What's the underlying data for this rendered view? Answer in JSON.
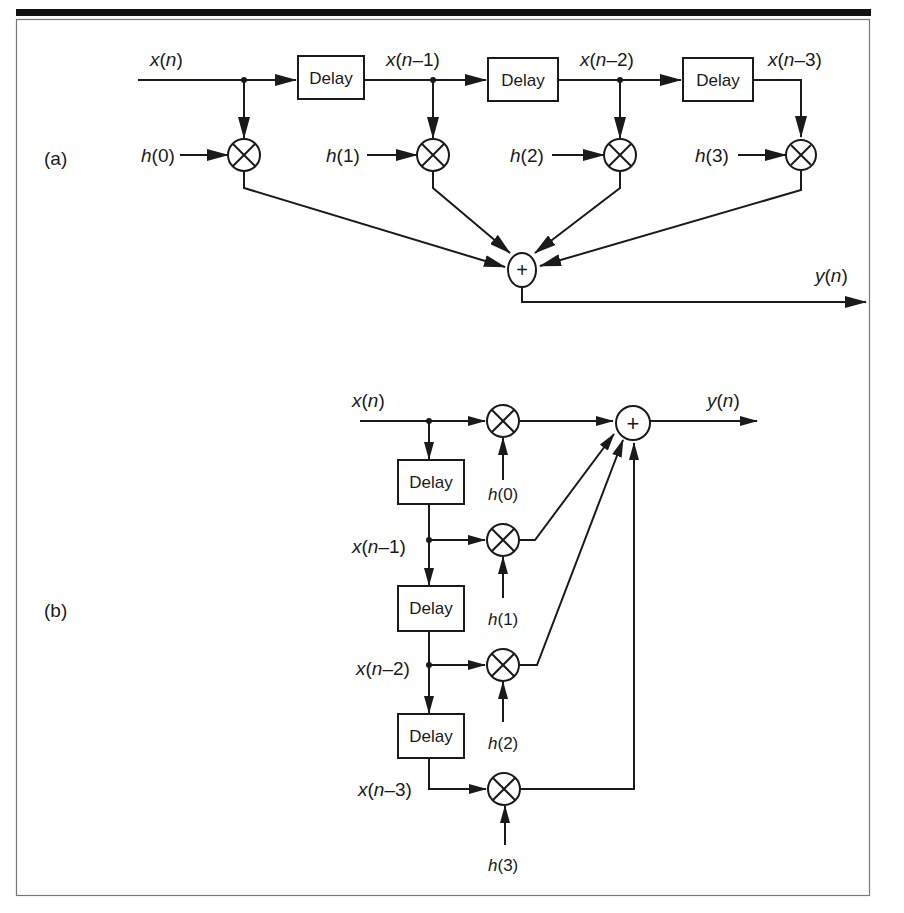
{
  "figure": {
    "panels": [
      {
        "id": "a",
        "label": "(a)",
        "input_label": {
          "var": "x",
          "arg": "n"
        },
        "delay_label": "Delay",
        "taps": [
          {
            "signal": {
              "var": "x",
              "arg": "n"
            },
            "coef": {
              "var": "h",
              "arg": "0"
            }
          },
          {
            "signal": {
              "var": "x",
              "arg": "n",
              "suffix": "–1"
            },
            "coef": {
              "var": "h",
              "arg": "1"
            }
          },
          {
            "signal": {
              "var": "x",
              "arg": "n",
              "suffix": "–2"
            },
            "coef": {
              "var": "h",
              "arg": "2"
            }
          },
          {
            "signal": {
              "var": "x",
              "arg": "n",
              "suffix": "–3"
            },
            "coef": {
              "var": "h",
              "arg": "3"
            }
          }
        ],
        "sum_symbol": "+",
        "mult_symbol": "⊗",
        "output_label": {
          "var": "y",
          "arg": "n"
        }
      },
      {
        "id": "b",
        "label": "(b)",
        "input_label": {
          "var": "x",
          "arg": "n"
        },
        "delay_label": "Delay",
        "taps": [
          {
            "signal": {
              "var": "x",
              "arg": "n"
            },
            "coef": {
              "var": "h",
              "arg": "0"
            }
          },
          {
            "signal": {
              "var": "x",
              "arg": "n",
              "suffix": "–1"
            },
            "coef": {
              "var": "h",
              "arg": "1"
            }
          },
          {
            "signal": {
              "var": "x",
              "arg": "n",
              "suffix": "–2"
            },
            "coef": {
              "var": "h",
              "arg": "2"
            }
          },
          {
            "signal": {
              "var": "x",
              "arg": "n",
              "suffix": "–3"
            },
            "coef": {
              "var": "h",
              "arg": "3"
            }
          }
        ],
        "sum_symbol": "+",
        "mult_symbol": "⊗",
        "output_label": {
          "var": "y",
          "arg": "n"
        }
      }
    ]
  },
  "text": {
    "a_label": "(a)",
    "b_label": "(b)",
    "delay": "Delay",
    "plus": "+",
    "x": "x",
    "y": "y",
    "h": "h",
    "n": "n",
    "lp": "(",
    "rp": ")",
    "m1": "–1",
    "m2": "–2",
    "m3": "–3",
    "k0": "0",
    "k1": "1",
    "k2": "2",
    "k3": "3"
  },
  "colors": {
    "ink": "#1a1a1a",
    "background": "#ffffff",
    "frame": "#555555",
    "rule": "#111111"
  }
}
